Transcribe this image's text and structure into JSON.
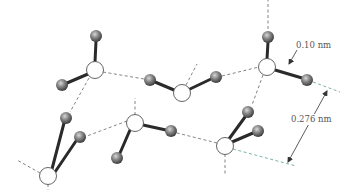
{
  "diagram": {
    "title": "",
    "colors": {
      "oxygen_fill": "#ffffff",
      "oxygen_stroke": "#555555",
      "hydrogen_fill": "#808080",
      "covalent_bond": "#2a2a2a",
      "hydrogen_bond": "#777777",
      "dimension_line": "#6aa8a0",
      "arrow": "#333333"
    },
    "annotations": {
      "bond_length": "0.10 nm",
      "hbond_distance": "0.276 nm"
    },
    "molecules": [
      {
        "id": "w1",
        "O": [
          95,
          70
        ],
        "H": [
          [
            96,
            36
          ],
          [
            62,
            85
          ]
        ]
      },
      {
        "id": "w2",
        "O": [
          182,
          93
        ],
        "H": [
          [
            150,
            80
          ],
          [
            216,
            77
          ]
        ]
      },
      {
        "id": "w3",
        "O": [
          267,
          67
        ],
        "H": [
          [
            268,
            37
          ],
          [
            307,
            80
          ]
        ]
      },
      {
        "id": "w4",
        "O": [
          48,
          176
        ],
        "H": [
          [
            66,
            118
          ],
          [
            80,
            137
          ]
        ]
      },
      {
        "id": "w5",
        "O": [
          135,
          123
        ],
        "H": [
          [
            117,
            158
          ],
          [
            171,
            131
          ]
        ]
      },
      {
        "id": "w6",
        "O": [
          225,
          146
        ],
        "H": [
          [
            248,
            112
          ],
          [
            258,
            131
          ]
        ]
      }
    ]
  }
}
